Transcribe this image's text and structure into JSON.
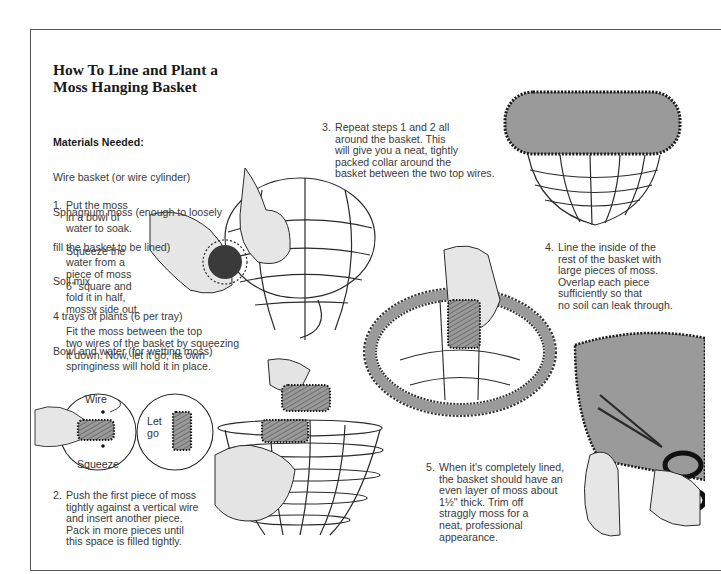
{
  "page": {
    "title_line1": "How To Line and Plant a",
    "title_line2": "Moss Hanging Basket"
  },
  "materials": {
    "heading": "Materials Needed:",
    "items": [
      "Wire basket (or wire cylinder)",
      "Sphagnum moss (enough to loosely",
      "fill the basket to be lined)",
      "Soil mix",
      "4 trays of plants (6 per tray)",
      "Bowl and water (for wetting moss)"
    ]
  },
  "steps": [
    {
      "number": "1.",
      "paragraphs": [
        "Put the moss\nin a bowl of\nwater to soak.",
        "Squeeze the\nwater from a\npiece of moss\n6\" square and\nfold it in half,\nmossy side out.",
        "Fit the moss between the top\ntwo wires of the basket by squeezing\nit down. Now, let it go; its own\nspringiness will hold it in place."
      ]
    },
    {
      "number": "2.",
      "text": "Push the first piece of moss\ntightly against a vertical wire\nand insert another piece.\nPack in more pieces until\nthis space is filled tightly."
    },
    {
      "number": "3.",
      "text": "Repeat steps 1 and 2 all\naround the basket. This\nwill give you a neat, tightly\npacked collar around the\nbasket between the two top wires."
    },
    {
      "number": "4.",
      "text": "Line the inside of the\nrest of the basket with\nlarge pieces of moss.\nOverlap each piece\nsufficiently so that\nno soil can leak through."
    },
    {
      "number": "5.",
      "text": "When it's completely lined,\nthe basket should have an\neven layer of moss about\n1½\" thick. Trim off\nstraggly moss for a\nneat, professional\nappearance."
    }
  ],
  "callouts": {
    "wire": "Wire",
    "squeeze": "Squeeze",
    "let_go_line1": "Let",
    "let_go_line2": "go"
  },
  "colors": {
    "ink": "#1a1a1a",
    "text": "#3a3a3a",
    "moss_gray": "#9a9a9a",
    "hand_gray": "#e4e4e4",
    "border": "#555555"
  }
}
